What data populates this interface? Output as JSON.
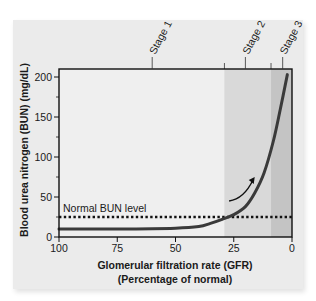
{
  "chart_data": {
    "type": "line",
    "title": "",
    "xlabel": "Glomerular filtration rate (GFR)",
    "xlabel_sub": "(Percentage of normal)",
    "ylabel": "Blood urea nitrogen (BUN) (mg/dL)",
    "xlim": [
      100,
      0
    ],
    "ylim": [
      0,
      210
    ],
    "x_ticks": [
      100,
      75,
      50,
      25,
      0
    ],
    "x_tick_labels": [
      "100",
      "75",
      "50",
      "25",
      "0"
    ],
    "y_ticks": [
      0,
      50,
      100,
      150,
      200
    ],
    "y_tick_labels": [
      "0",
      "50",
      "100",
      "150",
      "200"
    ],
    "y_minor_ticks": [
      25,
      75,
      125,
      175
    ],
    "grid": false,
    "series": [
      {
        "name": "BUN vs GFR",
        "x": [
          100,
          75,
          50,
          40,
          35,
          30,
          25,
          20,
          16,
          12,
          8,
          5,
          2
        ],
        "y": [
          10,
          10,
          11,
          13,
          17,
          22,
          28,
          38,
          55,
          80,
          120,
          160,
          203
        ]
      }
    ],
    "reference_lines": [
      {
        "label": "Normal BUN level",
        "y": 25,
        "style": "dotted"
      }
    ],
    "regions": [
      {
        "label": "Stage 1",
        "x_from": 100,
        "x_to": 29,
        "color": "#efefef",
        "label_x": 60
      },
      {
        "label": "Stage 2",
        "x_from": 29,
        "x_to": 9,
        "color": "#d9d9d9",
        "label_x": 20
      },
      {
        "label": "Stage 3",
        "x_from": 9,
        "x_to": 0,
        "color": "#c4c4c4",
        "label_x": 4
      }
    ],
    "annotations": [
      {
        "type": "arrow",
        "from": [
          27,
          45
        ],
        "to": [
          16,
          75
        ]
      }
    ],
    "colors": {
      "panel": "#ebebeb",
      "curve": "#3a3a3a",
      "frame": "#111111"
    }
  }
}
